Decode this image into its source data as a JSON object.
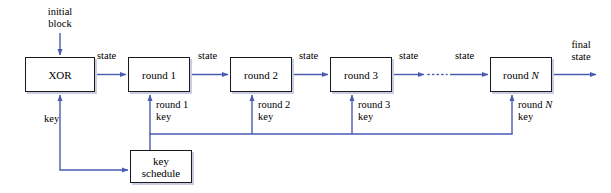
{
  "diagram": {
    "colors": {
      "line": "#4a5bb0",
      "box_border": "#1a1a1a",
      "box_shadow": "#c9cde4",
      "background": "#ffffff",
      "text": "#000000"
    },
    "nodes": [
      {
        "id": "xor",
        "label": "XOR",
        "x": 25,
        "y": 57,
        "w": 70,
        "h": 35
      },
      {
        "id": "round1",
        "label": "round 1",
        "x": 128,
        "y": 57,
        "w": 62,
        "h": 35
      },
      {
        "id": "round2",
        "label": "round 2",
        "x": 230,
        "y": 57,
        "w": 62,
        "h": 35
      },
      {
        "id": "round3",
        "label": "round 3",
        "x": 330,
        "y": 57,
        "w": 62,
        "h": 35
      },
      {
        "id": "roundn",
        "label": "round N",
        "x": 490,
        "y": 57,
        "w": 62,
        "h": 35
      },
      {
        "id": "keyschedule",
        "label": "key\nschedule",
        "x": 130,
        "y": 150,
        "w": 62,
        "h": 33
      }
    ],
    "labels": {
      "initial_block": "initial\nblock",
      "state_1": "state",
      "state_2": "state",
      "state_3": "state",
      "state_4": "state",
      "state_5": "state",
      "final_state": "final\nstate",
      "key": "key",
      "round1_key": "round 1\nkey",
      "round2_key": "round 2\nkey",
      "round3_key": "round 3\nkey",
      "roundn_key": "round N\nkey",
      "ellipsis": "······"
    }
  }
}
